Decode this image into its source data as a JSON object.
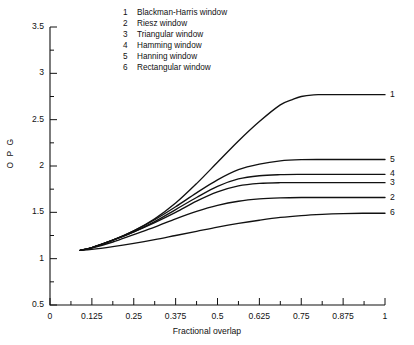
{
  "chart_data": {
    "type": "line",
    "title": "",
    "xlabel": "Fractional overlap",
    "ylabel": "O P G",
    "xlim": [
      0,
      1
    ],
    "ylim": [
      0.5,
      3.5
    ],
    "grid": false,
    "legend_position": "top-center-inside",
    "x_ticks": [
      "0",
      "0.125",
      "0.25",
      "0.375",
      "0.5",
      "0.625",
      "0.75",
      "0.875",
      "1"
    ],
    "x_tick_values": [
      0,
      0.125,
      0.25,
      0.375,
      0.5,
      0.625,
      0.75,
      0.875,
      1
    ],
    "x_minor_step": 0.0625,
    "y_ticks": [
      "0.5",
      "1",
      "1.5",
      "2",
      "2.5",
      "3",
      "3.5"
    ],
    "y_tick_values": [
      0.5,
      1,
      1.5,
      2,
      2.5,
      3,
      3.5
    ],
    "y_minor_step": 0.25,
    "series": [
      {
        "key": "1",
        "name": "Blackman-Harris window",
        "end_label": "1",
        "plateau": 2.77,
        "x": [
          0.09,
          0.125,
          0.1875,
          0.25,
          0.3125,
          0.375,
          0.4375,
          0.5,
          0.5625,
          0.625,
          0.6875,
          0.725,
          0.75,
          0.7875,
          0.8125,
          0.875,
          0.9375,
          1.0
        ],
        "y": [
          1.09,
          1.12,
          1.2,
          1.3,
          1.43,
          1.6,
          1.81,
          2.04,
          2.27,
          2.48,
          2.66,
          2.72,
          2.75,
          2.768,
          2.77,
          2.77,
          2.77,
          2.77
        ]
      },
      {
        "key": "5",
        "name": "Hanning window",
        "end_label": "5",
        "plateau": 2.07,
        "x": [
          0.09,
          0.125,
          0.1875,
          0.25,
          0.3125,
          0.375,
          0.4375,
          0.5,
          0.5625,
          0.625,
          0.6875,
          0.75,
          0.8125,
          0.875,
          0.9375,
          1.0
        ],
        "y": [
          1.09,
          1.12,
          1.2,
          1.3,
          1.42,
          1.56,
          1.71,
          1.85,
          1.96,
          2.02,
          2.055,
          2.068,
          2.07,
          2.07,
          2.07,
          2.07
        ]
      },
      {
        "key": "4",
        "name": "Hamming window",
        "end_label": "4",
        "plateau": 1.91,
        "x": [
          0.09,
          0.125,
          0.1875,
          0.25,
          0.3125,
          0.375,
          0.4375,
          0.5,
          0.5625,
          0.625,
          0.6875,
          0.75,
          0.8125,
          0.875,
          0.9375,
          1.0
        ],
        "y": [
          1.09,
          1.12,
          1.2,
          1.29,
          1.4,
          1.53,
          1.66,
          1.78,
          1.86,
          1.895,
          1.907,
          1.91,
          1.91,
          1.91,
          1.91,
          1.91
        ]
      },
      {
        "key": "3",
        "name": "Triangular window",
        "end_label": "3",
        "plateau": 1.82,
        "x": [
          0.09,
          0.125,
          0.1875,
          0.25,
          0.3125,
          0.375,
          0.4375,
          0.5,
          0.5625,
          0.625,
          0.6875,
          0.75,
          0.8125,
          0.875,
          0.9375,
          1.0
        ],
        "y": [
          1.09,
          1.12,
          1.2,
          1.29,
          1.39,
          1.5,
          1.62,
          1.72,
          1.785,
          1.812,
          1.82,
          1.82,
          1.82,
          1.82,
          1.82,
          1.82
        ]
      },
      {
        "key": "2",
        "name": "Riesz window",
        "end_label": "2",
        "plateau": 1.66,
        "x": [
          0.09,
          0.125,
          0.1875,
          0.25,
          0.3125,
          0.375,
          0.4375,
          0.5,
          0.5625,
          0.625,
          0.6875,
          0.75,
          0.8125,
          0.875,
          0.9375,
          1.0
        ],
        "y": [
          1.09,
          1.115,
          1.18,
          1.26,
          1.34,
          1.43,
          1.51,
          1.575,
          1.62,
          1.645,
          1.656,
          1.66,
          1.66,
          1.66,
          1.66,
          1.66
        ]
      },
      {
        "key": "6",
        "name": "Rectangular window",
        "end_label": "6",
        "plateau": 1.49,
        "x": [
          0.09,
          0.125,
          0.1875,
          0.25,
          0.3125,
          0.375,
          0.4375,
          0.5,
          0.5625,
          0.625,
          0.6875,
          0.75,
          0.8125,
          0.875,
          0.9375,
          1.0
        ],
        "y": [
          1.09,
          1.1,
          1.13,
          1.165,
          1.205,
          1.25,
          1.295,
          1.34,
          1.38,
          1.415,
          1.445,
          1.465,
          1.478,
          1.486,
          1.49,
          1.49
        ]
      }
    ]
  },
  "legend": {
    "entries": [
      {
        "key": "1",
        "label": "Blackman-Harris window"
      },
      {
        "key": "2",
        "label": "Riesz window"
      },
      {
        "key": "3",
        "label": "Triangular window"
      },
      {
        "key": "4",
        "label": "Hamming window"
      },
      {
        "key": "5",
        "label": "Hanning window"
      },
      {
        "key": "6",
        "label": "Rectangular window"
      }
    ]
  },
  "style": {
    "line_color": "#111111",
    "axis_color": "#111111",
    "background": "#ffffff"
  }
}
